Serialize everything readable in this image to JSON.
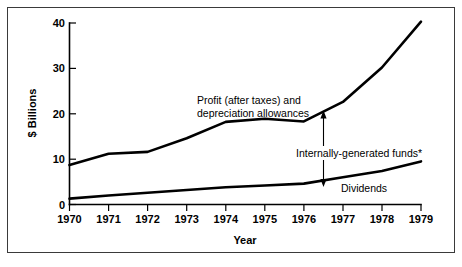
{
  "chart_data": {
    "type": "line",
    "title": "",
    "xlabel": "Year",
    "ylabel": "$ Billions",
    "x": [
      1970,
      1971,
      1972,
      1973,
      1974,
      1975,
      1976,
      1977,
      1978,
      1979
    ],
    "xtick_labels": [
      "1970",
      "1971",
      "1972",
      "1973",
      "1974",
      "1975",
      "1976",
      "1977",
      "1978",
      "1979"
    ],
    "ytick_labels": [
      "0",
      "10",
      "20",
      "30",
      "40"
    ],
    "ytick_values": [
      0,
      10,
      20,
      30,
      40
    ],
    "xlim": [
      1970,
      1979
    ],
    "ylim": [
      0,
      40
    ],
    "grid": false,
    "legend_position": "inline-annotations",
    "series": [
      {
        "name": "Profit (after taxes) and depreciation allowances",
        "values": [
          8.7,
          11.2,
          11.6,
          14.6,
          18.2,
          18.9,
          18.3,
          22.6,
          30.2,
          40.3
        ]
      },
      {
        "name": "Dividends",
        "values": [
          1.3,
          2.0,
          2.6,
          3.2,
          3.8,
          4.2,
          4.6,
          6.0,
          7.4,
          9.5
        ]
      }
    ],
    "annotations": [
      {
        "name": "profit-series-label",
        "text_line_1": "Profit (after taxes) and",
        "text_line_2": "depreciation allowances"
      },
      {
        "name": "internally-generated-funds-label",
        "text": "Internally-generated funds*"
      },
      {
        "name": "dividends-series-label",
        "text": "Dividends"
      }
    ],
    "arrow": {
      "name": "internally-generated-funds-arrow",
      "x_value": 1976.5,
      "y_top": 20.2,
      "y_bottom": 5.3,
      "double_headed": true
    },
    "colors": {
      "line": "#000000",
      "axis": "#000000",
      "background": "#ffffff",
      "frame": "#3a3a3a"
    }
  }
}
